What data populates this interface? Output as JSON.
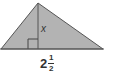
{
  "figure": {
    "shape": "triangle",
    "fill_color": "#b3b3b3",
    "stroke_color": "#555555",
    "vertices": {
      "left": [
        1,
        49
      ],
      "apex": [
        38,
        3
      ],
      "right": [
        103,
        49
      ]
    },
    "height_line": {
      "from": [
        38,
        3
      ],
      "to": [
        38,
        49
      ]
    },
    "right_angle_marker": true
  },
  "labels": {
    "height": "x",
    "base_whole": "2",
    "base_numerator": "1",
    "base_denominator": "2"
  }
}
